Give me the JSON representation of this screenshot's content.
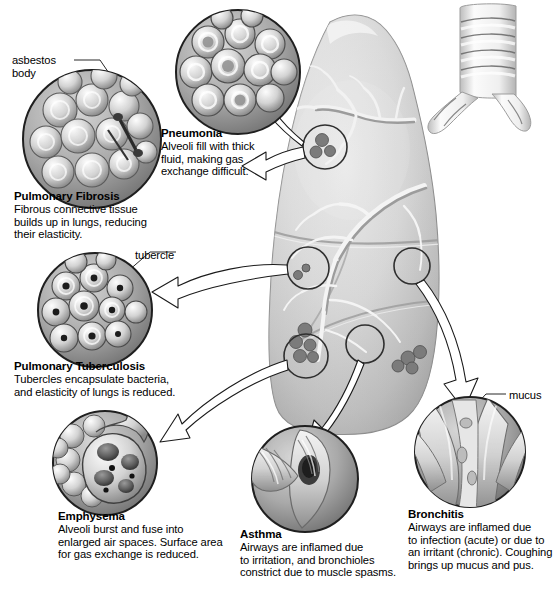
{
  "figure": {
    "organ_label": "lung",
    "colors": {
      "background": "#ffffff",
      "ink": "#000000",
      "lung_light": "#e2e2e2",
      "lung_mid": "#b9b9b9",
      "lung_dark": "#8e8e8e",
      "inset_rim": "#2b2b2b",
      "inset_fill": "#9a9a9a",
      "arrow_fill": "#ffffff",
      "arrow_stroke": "#1a1a1a"
    }
  },
  "pointer_labels": [
    {
      "name": "asbestos-body",
      "text": "asbestos\nbody"
    },
    {
      "name": "tubercle",
      "text": "tubercle"
    },
    {
      "name": "mucus",
      "text": "mucus"
    }
  ],
  "conditions": [
    {
      "id": "pulmonary-fibrosis",
      "title": "Pulmonary Fibrosis",
      "description": "Fibrous connective tissue\nbuilds up in lungs, reducing\ntheir elasticity."
    },
    {
      "id": "pneumonia",
      "title": "Pneumonia",
      "description": "Alveoli fill with thick\nfluid, making gas\nexchange difficult."
    },
    {
      "id": "pulmonary-tuberculosis",
      "title": "Pulmonary Tuberculosis",
      "description": "Tubercles encapsulate bacteria,\nand elasticity of lungs is reduced."
    },
    {
      "id": "emphysema",
      "title": "Emphysema",
      "description": "Alveoli burst and fuse into\nenlarged air spaces. Surface area\nfor gas exchange is reduced."
    },
    {
      "id": "asthma",
      "title": "Asthma",
      "description": "Airways are inflamed due\nto irritation, and bronchioles\nconstrict due to muscle spasms."
    },
    {
      "id": "bronchitis",
      "title": "Bronchitis",
      "description": "Airways are inflamed due\nto infection (acute) or due to\nan irritant (chronic). Coughing\nbrings  up mucus and pus."
    }
  ]
}
